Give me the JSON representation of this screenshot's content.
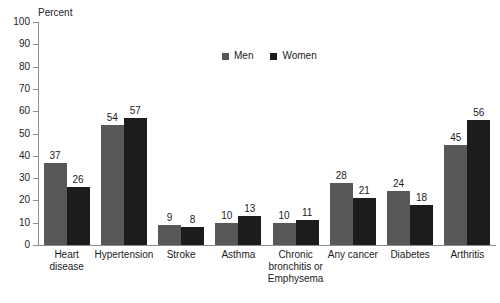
{
  "chart_data": {
    "type": "bar",
    "title": "",
    "xlabel": "",
    "ylabel": "Percent",
    "ylim": [
      0,
      100
    ],
    "ytick_labels": [
      "100",
      "90",
      "80",
      "70",
      "60",
      "50",
      "40",
      "30",
      "20",
      "10",
      "0"
    ],
    "yticks": [
      100,
      90,
      80,
      70,
      60,
      50,
      40,
      30,
      20,
      10,
      0
    ],
    "grid": false,
    "legend_position": "top-center",
    "categories": [
      "Heart disease",
      "Hypertension",
      "Stroke",
      "Asthma",
      "Chronic bronchitis or Emphysema",
      "Any cancer",
      "Diabetes",
      "Arthritis"
    ],
    "category_label_lines": [
      [
        "Heart",
        "disease"
      ],
      [
        "Hypertension"
      ],
      [
        "Stroke"
      ],
      [
        "Asthma"
      ],
      [
        "Chronic",
        "bronchitis or",
        "Emphysema"
      ],
      [
        "Any cancer"
      ],
      [
        "Diabetes"
      ],
      [
        "Arthritis"
      ]
    ],
    "series": [
      {
        "name": "Men",
        "color": "#585858",
        "values": [
          37,
          54,
          9,
          10,
          10,
          28,
          24,
          45
        ]
      },
      {
        "name": "Women",
        "color": "#1c1c1c",
        "values": [
          26,
          57,
          8,
          13,
          11,
          21,
          18,
          56
        ]
      }
    ]
  },
  "legend": {
    "items": [
      {
        "label": "Men",
        "color": "#585858"
      },
      {
        "label": "Women",
        "color": "#1c1c1c"
      }
    ]
  },
  "colors": {
    "men": "#585858",
    "women": "#1c1c1c",
    "axis": "#8c8c8c",
    "text": "#1c1c1c",
    "background": "#ffffff"
  }
}
